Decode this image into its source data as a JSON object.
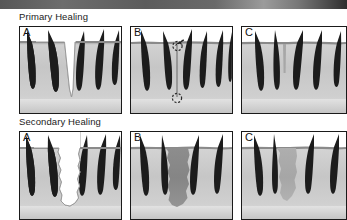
{
  "figure": {
    "title_primary": "Primary Healing",
    "title_secondary": "Secondary Healing",
    "panel_letters": [
      "A",
      "B",
      "C"
    ],
    "colors": {
      "skin_light": "#e6e6e6",
      "skin_mid": "#c9c9c9",
      "skin_dark": "#b4b4b4",
      "epidermis_line": "#7a7a7a",
      "subcutis": "#d9d9d9",
      "hair": "#1c1c1c",
      "granulation": "#8c8c8c",
      "scar": "#a9a9a9",
      "wound_open": "#ffffff",
      "border": "#1a1a1a",
      "band": "#5c5c5c"
    }
  },
  "rows": [
    {
      "name": "primary-healing",
      "label": "Primary Healing",
      "panels": [
        {
          "letter": "A",
          "name": "primary-panel-a",
          "caption": "Narrow V-shaped incisional wound with clean apposed edges",
          "wound_type": "incision-open",
          "follicles": 5
        },
        {
          "letter": "B",
          "name": "primary-panel-b",
          "caption": "Wound edges approximated by suture; entry and exit points marked",
          "wound_type": "sutured",
          "follicles": 6,
          "annotations": [
            "suture-thread",
            "suture-entry-circle",
            "suture-exit-circle"
          ]
        },
        {
          "letter": "C",
          "name": "primary-panel-c",
          "caption": "Healed with minimal thin linear scar",
          "wound_type": "thin-scar",
          "follicles": 5
        }
      ]
    },
    {
      "name": "secondary-healing",
      "label": "Secondary Healing",
      "panels": [
        {
          "letter": "A",
          "name": "secondary-panel-a",
          "caption": "Wide irregular tissue defect left open",
          "wound_type": "defect-open",
          "follicles": 5
        },
        {
          "letter": "B",
          "name": "secondary-panel-b",
          "caption": "Defect filled by granulation tissue",
          "wound_type": "granulation",
          "follicles": 4
        },
        {
          "letter": "C",
          "name": "secondary-panel-c",
          "caption": "Healed with broad fibrous scar and loss of follicles",
          "wound_type": "broad-scar",
          "follicles": 4
        }
      ]
    }
  ]
}
